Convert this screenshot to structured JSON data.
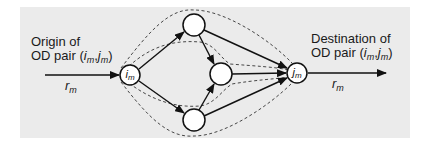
{
  "diagram": {
    "type": "network-flow",
    "background_color": "#ebebeb",
    "origin_label": {
      "line1": "Origin of",
      "line2_prefix": "OD pair (",
      "i_sym": "i",
      "i_sub": "m",
      "sep": ",",
      "j_sym": "j",
      "j_sub": "m",
      "close": ")"
    },
    "destination_label": {
      "line1": "Destination of",
      "line2_prefix": "OD pair (",
      "i_sym": "i",
      "i_sub": "m",
      "sep": ",",
      "j_sym": "j",
      "j_sub": "m",
      "close": ")"
    },
    "input_flow": {
      "sym": "r",
      "sub": "m"
    },
    "output_flow": {
      "sym": "r",
      "sub": "m"
    },
    "nodes": [
      {
        "id": "origin",
        "label_sym": "i",
        "label_sub": "m",
        "cx": 130,
        "cy": 75
      },
      {
        "id": "top",
        "label_sym": "",
        "label_sub": "",
        "cx": 194,
        "cy": 25
      },
      {
        "id": "middle",
        "label_sym": "",
        "label_sub": "",
        "cx": 221,
        "cy": 74
      },
      {
        "id": "bottom",
        "label_sym": "",
        "label_sub": "",
        "cx": 194,
        "cy": 120
      },
      {
        "id": "destination",
        "label_sym": "j",
        "label_sub": "m",
        "cx": 297,
        "cy": 73
      }
    ],
    "edges": [
      {
        "from": "origin",
        "to": "top"
      },
      {
        "from": "origin",
        "to": "bottom"
      },
      {
        "from": "top",
        "to": "middle"
      },
      {
        "from": "bottom",
        "to": "middle"
      },
      {
        "from": "top",
        "to": "destination"
      },
      {
        "from": "middle",
        "to": "destination"
      },
      {
        "from": "bottom",
        "to": "destination"
      }
    ],
    "paths_dashed": 4
  }
}
